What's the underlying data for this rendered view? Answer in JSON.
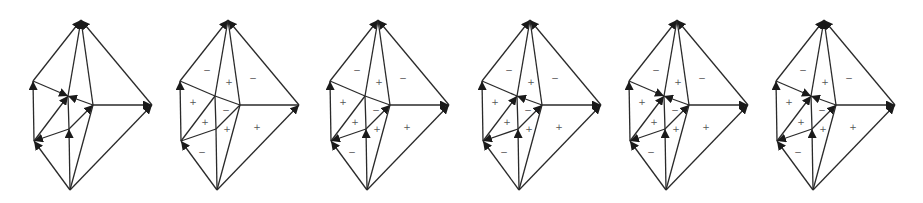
{
  "figure": {
    "colors": {
      "stroke": "#2a2a2a",
      "sign": "#555555",
      "background": "#ffffff"
    },
    "node_layout": {
      "A": [
        11,
        20
      ],
      "B": [
        -37,
        81
      ],
      "C": [
        -2,
        96
      ],
      "D": [
        23,
        105
      ],
      "E": [
        82,
        105
      ],
      "F": [
        -36,
        141
      ],
      "G": [
        -1,
        129
      ],
      "H": [
        0,
        190
      ]
    },
    "edges": [
      [
        "A",
        "B"
      ],
      [
        "A",
        "C"
      ],
      [
        "A",
        "D"
      ],
      [
        "A",
        "E"
      ],
      [
        "B",
        "C"
      ],
      [
        "C",
        "D"
      ],
      [
        "B",
        "F"
      ],
      [
        "C",
        "F"
      ],
      [
        "F",
        "G"
      ],
      [
        "G",
        "D"
      ],
      [
        "C",
        "G"
      ],
      [
        "G",
        "H"
      ],
      [
        "D",
        "E"
      ],
      [
        "D",
        "H"
      ],
      [
        "E",
        "H"
      ],
      [
        "F",
        "H"
      ]
    ],
    "panels": [
      {
        "id": "panel-1",
        "cx": 70,
        "arrows": [
          [
            "B",
            "A"
          ],
          [
            "C",
            "A"
          ],
          [
            "D",
            "A"
          ],
          [
            "E",
            "A"
          ],
          [
            "B",
            "C"
          ],
          [
            "D",
            "C"
          ],
          [
            "F",
            "C"
          ],
          [
            "F",
            "B"
          ],
          [
            "G",
            "D"
          ],
          [
            "D",
            "E"
          ],
          [
            "H",
            "E"
          ],
          [
            "G",
            "F"
          ],
          [
            "H",
            "F"
          ],
          [
            "H",
            "G"
          ]
        ],
        "signs": []
      },
      {
        "id": "panel-2",
        "cx": 217,
        "arrows": [
          [
            "B",
            "A"
          ],
          [
            "E",
            "A"
          ],
          [
            "F",
            "B"
          ],
          [
            "H",
            "F"
          ],
          [
            "H",
            "E"
          ]
        ],
        "signs": [
          {
            "t": "−",
            "dx": -10,
            "y": 70
          },
          {
            "t": "+",
            "dx": 12,
            "y": 82
          },
          {
            "t": "−",
            "dx": 36,
            "y": 78
          },
          {
            "t": "+",
            "dx": -24,
            "y": 102
          },
          {
            "t": "−",
            "dx": 9,
            "y": 110
          },
          {
            "t": "+",
            "dx": -12,
            "y": 122
          },
          {
            "t": "+",
            "dx": 10,
            "y": 129
          },
          {
            "t": "+",
            "dx": 40,
            "y": 127
          },
          {
            "t": "−",
            "dx": -15,
            "y": 152
          }
        ]
      },
      {
        "id": "panel-3",
        "cx": 367,
        "arrows": [
          [
            "B",
            "A"
          ],
          [
            "E",
            "A"
          ],
          [
            "F",
            "B"
          ],
          [
            "H",
            "F"
          ],
          [
            "H",
            "E"
          ],
          [
            "D",
            "E"
          ],
          [
            "G",
            "D"
          ],
          [
            "G",
            "F"
          ],
          [
            "H",
            "G"
          ]
        ],
        "signs": [
          {
            "t": "−",
            "dx": -10,
            "y": 70
          },
          {
            "t": "+",
            "dx": 12,
            "y": 82
          },
          {
            "t": "−",
            "dx": 36,
            "y": 78
          },
          {
            "t": "+",
            "dx": -24,
            "y": 102
          },
          {
            "t": "−",
            "dx": 9,
            "y": 110
          },
          {
            "t": "+",
            "dx": -12,
            "y": 122
          },
          {
            "t": "+",
            "dx": 10,
            "y": 129
          },
          {
            "t": "+",
            "dx": 40,
            "y": 127
          },
          {
            "t": "−",
            "dx": -15,
            "y": 152
          }
        ]
      },
      {
        "id": "panel-4",
        "cx": 519,
        "arrows": [
          [
            "B",
            "A"
          ],
          [
            "E",
            "A"
          ],
          [
            "F",
            "B"
          ],
          [
            "H",
            "F"
          ],
          [
            "H",
            "E"
          ],
          [
            "D",
            "E"
          ],
          [
            "G",
            "D"
          ],
          [
            "G",
            "F"
          ],
          [
            "H",
            "G"
          ],
          [
            "F",
            "C"
          ],
          [
            "D",
            "C"
          ]
        ],
        "signs": [
          {
            "t": "−",
            "dx": -10,
            "y": 70
          },
          {
            "t": "+",
            "dx": 12,
            "y": 82
          },
          {
            "t": "−",
            "dx": 36,
            "y": 78
          },
          {
            "t": "+",
            "dx": -24,
            "y": 102
          },
          {
            "t": "−",
            "dx": 9,
            "y": 110
          },
          {
            "t": "+",
            "dx": -12,
            "y": 122
          },
          {
            "t": "+",
            "dx": 10,
            "y": 129
          },
          {
            "t": "+",
            "dx": 40,
            "y": 127
          },
          {
            "t": "−",
            "dx": -15,
            "y": 152
          }
        ]
      },
      {
        "id": "panel-5",
        "cx": 666,
        "arrows": [
          [
            "B",
            "A"
          ],
          [
            "E",
            "A"
          ],
          [
            "F",
            "B"
          ],
          [
            "H",
            "F"
          ],
          [
            "H",
            "E"
          ],
          [
            "D",
            "E"
          ],
          [
            "G",
            "D"
          ],
          [
            "G",
            "F"
          ],
          [
            "H",
            "G"
          ],
          [
            "F",
            "C"
          ],
          [
            "D",
            "C"
          ],
          [
            "B",
            "C"
          ]
        ],
        "signs": [
          {
            "t": "−",
            "dx": -10,
            "y": 70
          },
          {
            "t": "+",
            "dx": 12,
            "y": 82
          },
          {
            "t": "−",
            "dx": 36,
            "y": 78
          },
          {
            "t": "+",
            "dx": -24,
            "y": 102
          },
          {
            "t": "−",
            "dx": 9,
            "y": 110
          },
          {
            "t": "+",
            "dx": -12,
            "y": 122
          },
          {
            "t": "+",
            "dx": 10,
            "y": 129
          },
          {
            "t": "+",
            "dx": 40,
            "y": 127
          },
          {
            "t": "−",
            "dx": -15,
            "y": 152
          }
        ]
      },
      {
        "id": "panel-6",
        "cx": 813,
        "arrows": [
          [
            "B",
            "A"
          ],
          [
            "C",
            "A"
          ],
          [
            "D",
            "A"
          ],
          [
            "E",
            "A"
          ],
          [
            "F",
            "B"
          ],
          [
            "H",
            "F"
          ],
          [
            "H",
            "E"
          ],
          [
            "D",
            "E"
          ],
          [
            "G",
            "D"
          ],
          [
            "G",
            "F"
          ],
          [
            "H",
            "G"
          ],
          [
            "F",
            "C"
          ],
          [
            "D",
            "C"
          ],
          [
            "B",
            "C"
          ]
        ],
        "signs": [
          {
            "t": "−",
            "dx": -10,
            "y": 70
          },
          {
            "t": "+",
            "dx": 12,
            "y": 82
          },
          {
            "t": "−",
            "dx": 36,
            "y": 78
          },
          {
            "t": "+",
            "dx": -24,
            "y": 102
          },
          {
            "t": "−",
            "dx": 9,
            "y": 110
          },
          {
            "t": "+",
            "dx": -12,
            "y": 122
          },
          {
            "t": "+",
            "dx": 10,
            "y": 129
          },
          {
            "t": "+",
            "dx": 40,
            "y": 127
          },
          {
            "t": "−",
            "dx": -15,
            "y": 152
          }
        ]
      }
    ]
  }
}
